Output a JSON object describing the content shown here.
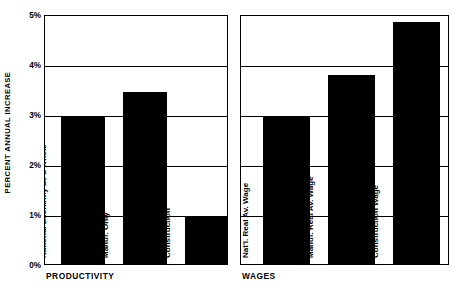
{
  "chart_data": {
    "type": "bar",
    "title": "",
    "subtitle": "",
    "xlabel": "",
    "ylabel": "PERCENT ANNUAL INCREASE",
    "ylim": [
      0,
      5
    ],
    "y_tick_labels": [
      "0%",
      "1%",
      "2%",
      "3%",
      "4%",
      "5%"
    ],
    "y_tick_values": [
      0,
      1,
      2,
      3,
      4,
      5
    ],
    "grid": true,
    "grid_axis": "y",
    "legend": "none",
    "bar_color": "#000000",
    "panels": [
      {
        "name": "PRODUCTIVITY",
        "categories": [
          "National Economy as a Whole",
          "Manuf. Only",
          "Construction"
        ],
        "values": [
          2.95,
          3.45,
          0.95
        ]
      },
      {
        "name": "WAGES",
        "categories": [
          "Nat'l. Real Av. Wage",
          "Manuf. Real Av. Wage",
          "Construction Wage"
        ],
        "values": [
          2.95,
          3.78,
          4.85
        ]
      }
    ]
  },
  "axis": {
    "y_title": "PERCENT ANNUAL INCREASE",
    "ticks": [
      {
        "label": "5%",
        "value": 5
      },
      {
        "label": "4%",
        "value": 4
      },
      {
        "label": "3%",
        "value": 3
      },
      {
        "label": "2%",
        "value": 2
      },
      {
        "label": "1%",
        "value": 1
      },
      {
        "label": "0%",
        "value": 0
      }
    ]
  },
  "panels": {
    "productivity": {
      "caption": "PRODUCTIVITY",
      "bars": [
        {
          "label": "National Economy as a Whole",
          "value": 2.95
        },
        {
          "label": "Manuf. Only",
          "value": 3.45
        },
        {
          "label": "Construction",
          "value": 0.95
        }
      ]
    },
    "wages": {
      "caption": "WAGES",
      "bars": [
        {
          "label": "Nat'l. Real Av. Wage",
          "value": 2.95
        },
        {
          "label": "Manuf. Real Av. Wage",
          "value": 3.78
        },
        {
          "label": "Construction Wage",
          "value": 4.85
        }
      ]
    }
  }
}
